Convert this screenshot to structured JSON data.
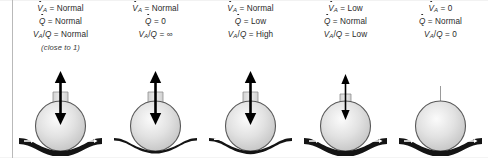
{
  "figure": {
    "colors": {
      "alveolus_fill_light": "#f2f2f2",
      "alveolus_fill_mid": "#d8d8d8",
      "alveolus_outline": "#4f4f4f",
      "capillary": "#1a1a1a",
      "arrow": "#000000",
      "text": "#2a2a2a",
      "rule": "#b9b9b9"
    }
  },
  "columns": [
    {
      "id": "normal",
      "ventilation": {
        "symbol": "V",
        "subscript": "A",
        "accent": "dot",
        "operator": "=",
        "value": "Normal"
      },
      "perfusion": {
        "symbol": "Q",
        "accent": "dot",
        "operator": "=",
        "value": "Normal"
      },
      "ratio": {
        "symbol": "V",
        "subscript": "A",
        "denominator": "Q",
        "operator": "=",
        "value": "Normal"
      },
      "note": "(close to 1)",
      "airflow_arrow": "double-headed-normal",
      "blood_flow": "normal",
      "airway": "open"
    },
    {
      "id": "dead-space",
      "ventilation": {
        "symbol": "V",
        "subscript": "A",
        "accent": "dot",
        "operator": "=",
        "value": "Normal"
      },
      "perfusion": {
        "symbol": "Q",
        "accent": "dot",
        "operator": "=",
        "value": "0"
      },
      "ratio": {
        "symbol": "V",
        "subscript": "A",
        "denominator": "Q",
        "operator": "=",
        "value": "∞"
      },
      "note": "",
      "airflow_arrow": "double-headed-normal",
      "blood_flow": "none",
      "airway": "open"
    },
    {
      "id": "high-ratio",
      "ventilation": {
        "symbol": "V",
        "subscript": "A",
        "accent": "dot",
        "operator": "=",
        "value": "Normal"
      },
      "perfusion": {
        "symbol": "Q",
        "accent": "dot",
        "operator": "=",
        "value": "Low"
      },
      "ratio": {
        "symbol": "V",
        "subscript": "A",
        "denominator": "Q",
        "operator": "=",
        "value": "High"
      },
      "note": "",
      "airflow_arrow": "double-headed-normal",
      "blood_flow": "low",
      "airway": "open"
    },
    {
      "id": "low-ratio",
      "ventilation": {
        "symbol": "V",
        "subscript": "A",
        "accent": "dot",
        "operator": "=",
        "value": "Low"
      },
      "perfusion": {
        "symbol": "Q",
        "accent": "dot",
        "operator": "=",
        "value": "Normal"
      },
      "ratio": {
        "symbol": "V",
        "subscript": "A",
        "denominator": "Q",
        "operator": "=",
        "value": "Low"
      },
      "note": "",
      "airflow_arrow": "double-headed-small",
      "blood_flow": "normal",
      "airway": "narrowed"
    },
    {
      "id": "shunt",
      "ventilation": {
        "symbol": "V",
        "subscript": "A",
        "accent": "dot",
        "operator": "=",
        "value": "0"
      },
      "perfusion": {
        "symbol": "Q",
        "accent": "dot",
        "operator": "=",
        "value": "Normal"
      },
      "ratio": {
        "symbol": "V",
        "subscript": "A",
        "denominator": "Q",
        "operator": "=",
        "value": "0"
      },
      "note": "",
      "airflow_arrow": "none",
      "blood_flow": "normal",
      "airway": "closed"
    }
  ]
}
